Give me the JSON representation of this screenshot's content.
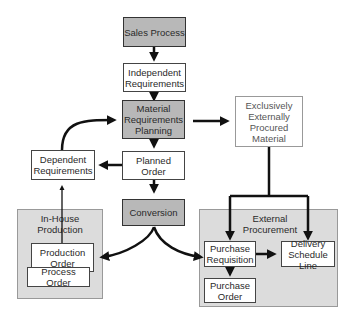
{
  "diagram": {
    "nodes": {
      "sales_process": "Sales Process",
      "independent_requirements": "Independent Requirements",
      "mrp": "Material Requirements Planning",
      "exclusively_external": "Exclusively Externally Procured Material",
      "dependent_requirements": "Dependent Requirements",
      "planned_order": "Planned Order",
      "conversion": "Conversion",
      "production_order": "Production Order",
      "process_order": "Process Order",
      "purchase_requisition": "Purchase Requisition",
      "delivery_schedule_line": "Delivery Schedule Line",
      "purchase_order": "Purchase Order"
    },
    "groups": {
      "in_house": "In-House Production",
      "external": "External Procurement"
    },
    "colors": {
      "highlight_fill": "#b8b8b8",
      "group_fill": "#dcdcdc",
      "line": "#111111"
    }
  }
}
